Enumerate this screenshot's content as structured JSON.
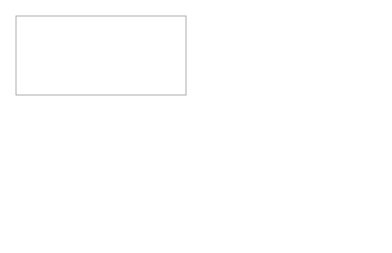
{
  "panel_a": {
    "tab_label": "facebook",
    "caption": "a)"
  },
  "panel_b": {
    "tab_label": "user-centered approach",
    "facebook_box_label": "facebook",
    "kino_box_label": "KINO",
    "caption": "b)"
  },
  "colors": {
    "frame": "#9a9a9a",
    "ellipse_dash": "#a0a0a0",
    "arrow": "#333333",
    "figure": "#222222",
    "faded": "#bbbbbb"
  }
}
